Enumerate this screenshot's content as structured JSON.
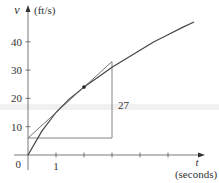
{
  "chart_data": {
    "type": "line",
    "title": "",
    "xlabel": "t",
    "xlabel_units": "(seconds)",
    "ylabel": "v",
    "ylabel_units": "(ft/s)",
    "xlim": [
      0,
      6.6
    ],
    "ylim": [
      0,
      50
    ],
    "x_ticks": [
      1,
      2,
      3,
      4,
      5
    ],
    "x_tick_labels": [
      "1"
    ],
    "y_ticks": [
      10,
      20,
      30,
      40
    ],
    "y_tick_labels": [
      "10",
      "20",
      "30",
      "40"
    ],
    "origin_label": "0",
    "grid": false,
    "series": [
      {
        "name": "velocity curve",
        "x": [
          0,
          0.5,
          1,
          1.5,
          2,
          2.5,
          3,
          3.5,
          4,
          4.5,
          5,
          5.5,
          5.93
        ],
        "y": [
          0,
          8.5,
          15,
          20,
          24,
          27.5,
          31,
          34,
          37,
          40,
          42.5,
          45,
          47
        ]
      },
      {
        "name": "tangent line at t=2",
        "x": [
          0,
          3
        ],
        "y": [
          6,
          33
        ]
      }
    ],
    "point": {
      "x": 2,
      "y": 24
    },
    "slope_triangle": {
      "x_start": 0,
      "x_end": 3,
      "y_base": 6,
      "y_top": 33,
      "rise_label": "27"
    }
  }
}
